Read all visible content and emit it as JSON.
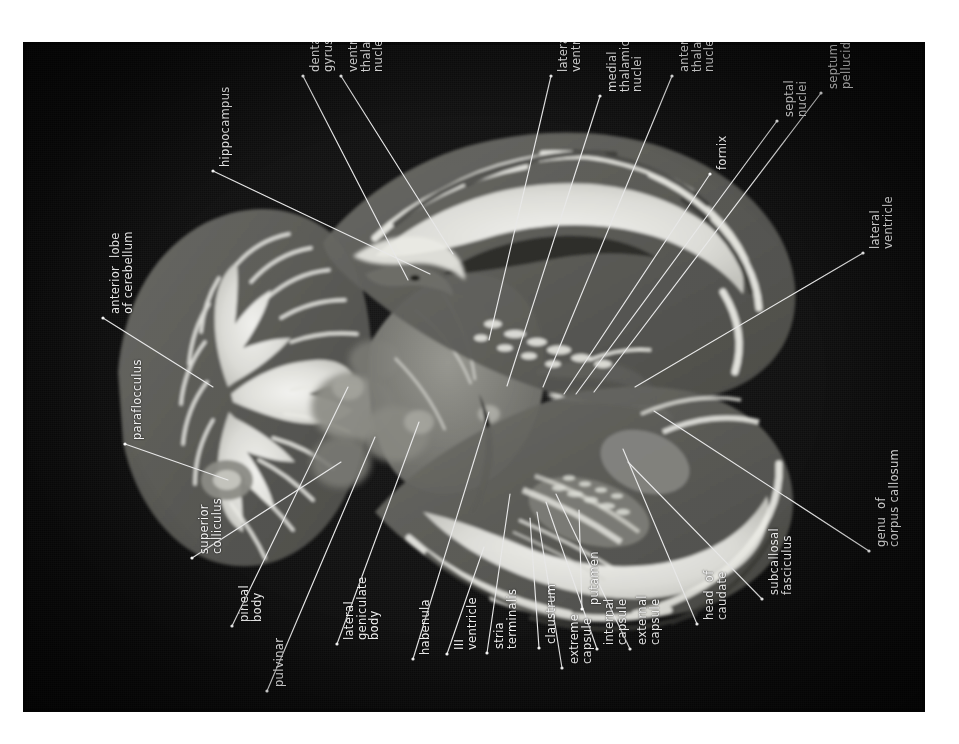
{
  "figure": {
    "kind": "anatomical-plate",
    "orientation": "plate rotated 90 degrees; all labels read bottom-to-top",
    "plate_background": "#0c0c0c",
    "label_color": "#f2f2f2",
    "leader_color": "#e8e8e8"
  },
  "labels": [
    {
      "id": "dentate-gyrus",
      "text": "dentate\ngyrus",
      "x": 286,
      "y": 30,
      "tip": [
        385,
        238
      ]
    },
    {
      "id": "ventral-thalamic-nuclei",
      "text": "ventral\nthalamic\nnuclei",
      "x": 324,
      "y": 30,
      "tip": [
        430,
        212
      ]
    },
    {
      "id": "hippocampus",
      "text": "hippocampus",
      "x": 196,
      "y": 125,
      "tip": [
        407,
        232
      ]
    },
    {
      "id": "lateral-ventricle-1",
      "text": "lateral\nventricle",
      "x": 534,
      "y": 30,
      "tip": [
        466,
        298
      ]
    },
    {
      "id": "medial-thalamic-nuclei",
      "text": "medial\nthalamic\nnuclei",
      "x": 583,
      "y": 50,
      "tip": [
        484,
        344
      ]
    },
    {
      "id": "anterior-thalamic-nuclei",
      "text": "anterior\nthalamic\nnuclei",
      "x": 655,
      "y": 30,
      "tip": [
        520,
        345
      ]
    },
    {
      "id": "fornix",
      "text": "fornix",
      "x": 693,
      "y": 128,
      "tip": [
        541,
        352
      ]
    },
    {
      "id": "septal-nuclei",
      "text": "septal\nnuclei",
      "x": 760,
      "y": 75,
      "tip": [
        553,
        352
      ]
    },
    {
      "id": "septum-pellucidum",
      "text": "septum\npellucidum",
      "x": 804,
      "y": 47,
      "tip": [
        571,
        350
      ]
    },
    {
      "id": "lateral-ventricle-2",
      "text": "lateral\nventricle",
      "x": 846,
      "y": 207,
      "tip": [
        612,
        345
      ]
    },
    {
      "id": "genu-of-corpus-callosum",
      "text": "genu  of\ncorpus callosum",
      "x": 852,
      "y": 505,
      "tip": [
        631,
        369
      ]
    },
    {
      "id": "subcallosal-fasciculus",
      "text": "subcallosal\nfasciculus",
      "x": 745,
      "y": 553,
      "tip": [
        605,
        420
      ]
    },
    {
      "id": "head-of-caudate",
      "text": "head  of\ncaudate",
      "x": 680,
      "y": 578,
      "tip": [
        600,
        407
      ]
    },
    {
      "id": "external-capsule",
      "text": "external\ncapsule",
      "x": 613,
      "y": 603,
      "tip": [
        533,
        452
      ]
    },
    {
      "id": "internal-capsule",
      "text": "internal\ncapsule",
      "x": 580,
      "y": 603,
      "tip": [
        523,
        460
      ]
    },
    {
      "id": "putamen",
      "text": "putamen",
      "x": 565,
      "y": 563,
      "tip": [
        556,
        468
      ]
    },
    {
      "id": "extreme-capsule",
      "text": "extreme\ncapsule",
      "x": 545,
      "y": 622,
      "tip": [
        514,
        470
      ]
    },
    {
      "id": "claustrum",
      "text": "claustrum",
      "x": 522,
      "y": 602,
      "tip": [
        507,
        476
      ]
    },
    {
      "id": "stria-terminalis",
      "text": "stria\nterminalis",
      "x": 470,
      "y": 607,
      "tip": [
        487,
        452
      ]
    },
    {
      "id": "iii-ventricle",
      "text": "ΙΙΙ\nventricle",
      "x": 430,
      "y": 608,
      "tip": [
        461,
        505
      ]
    },
    {
      "id": "habenula",
      "text": "habenula",
      "x": 396,
      "y": 613,
      "tip": [
        466,
        370
      ]
    },
    {
      "id": "lateral-geniculate-body",
      "text": "lateral\ngeniculate\nbody",
      "x": 320,
      "y": 598,
      "tip": [
        396,
        380
      ]
    },
    {
      "id": "pulvinar",
      "text": "pulvinar",
      "x": 250,
      "y": 645,
      "tip": [
        352,
        395
      ]
    },
    {
      "id": "pineal-body",
      "text": "pineal\nbody",
      "x": 215,
      "y": 580,
      "tip": [
        325,
        345
      ]
    },
    {
      "id": "superior-colliculus",
      "text": "superior\ncolliculus",
      "x": 175,
      "y": 512,
      "tip": [
        318,
        420
      ]
    },
    {
      "id": "paraflocculus",
      "text": "paraflocculus",
      "x": 108,
      "y": 398,
      "tip": [
        205,
        438
      ]
    },
    {
      "id": "anterior-lobe-of-cerebellum",
      "text": "anterior  lobe\nof cerebellum",
      "x": 86,
      "y": 272,
      "tip": [
        190,
        345
      ]
    }
  ],
  "label_count": 27
}
